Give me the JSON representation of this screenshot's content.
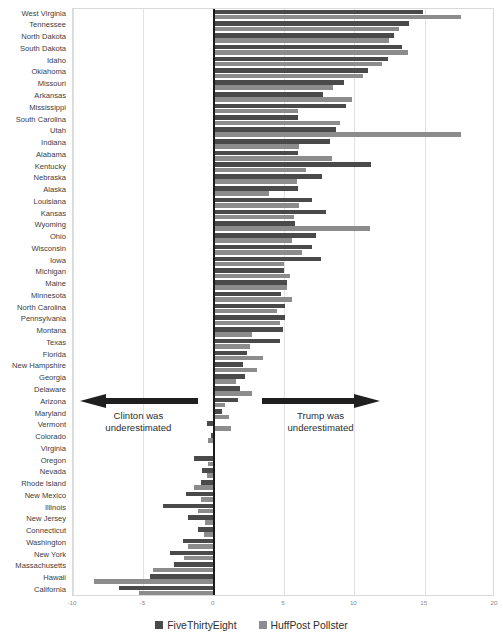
{
  "chart_data": {
    "type": "bar",
    "orientation": "horizontal",
    "title": "",
    "xlabel": "",
    "ylabel": "",
    "xlim": [
      -10,
      20
    ],
    "xticks": [
      -10,
      -5,
      0,
      5,
      10,
      15,
      20
    ],
    "grid": true,
    "legend_position": "bottom",
    "categories": [
      "West Virginia",
      "Tennessee",
      "North Dakota",
      "South Dakota",
      "Idaho",
      "Oklahoma",
      "Missouri",
      "Arkansas",
      "Mississippi",
      "South Carolina",
      "Utah",
      "Indiana",
      "Alabama",
      "Kentucky",
      "Nebraska",
      "Alaska",
      "Louisiana",
      "Kansas",
      "Wyoming",
      "Ohio",
      "Wisconsin",
      "Iowa",
      "Michigan",
      "Maine",
      "Minnesota",
      "North Carolina",
      "Pennsylvania",
      "Montana",
      "Texas",
      "Florida",
      "New Hampshire",
      "Georgia",
      "Delaware",
      "Arizona",
      "Maryland",
      "Vermont",
      "Colorado",
      "Virginia",
      "Oregon",
      "Nevada",
      "Rhode Island",
      "New Mexico",
      "Illinois",
      "New Jersey",
      "Connecticut",
      "Washington",
      "New York",
      "Massachusetts",
      "Hawaii",
      "California"
    ],
    "series": [
      {
        "name": "FiveThirtyEight",
        "color": "#4a4a4a",
        "values": [
          14.9,
          13.9,
          12.8,
          13.4,
          12.4,
          11.0,
          9.3,
          7.8,
          9.4,
          6.0,
          8.7,
          8.3,
          6.0,
          11.2,
          7.7,
          6.0,
          7.0,
          8.0,
          5.8,
          7.3,
          7.0,
          7.6,
          5.0,
          5.2,
          4.8,
          5.1,
          5.1,
          4.9,
          4.7,
          2.4,
          2.1,
          2.2,
          1.9,
          1.7,
          0.6,
          -0.5,
          -0.2,
          0.1,
          -1.4,
          -0.8,
          -0.9,
          -2.0,
          -3.6,
          -1.8,
          -1.1,
          -2.2,
          -3.1,
          -2.8,
          -4.5,
          -6.7
        ]
      },
      {
        "name": "HuffPost Pollster",
        "color": "#8c8c8c",
        "values": [
          17.6,
          13.2,
          12.5,
          13.8,
          12.0,
          10.6,
          8.5,
          9.8,
          6.0,
          9.0,
          17.6,
          6.1,
          8.4,
          6.6,
          5.9,
          3.9,
          6.1,
          5.7,
          11.1,
          5.6,
          6.3,
          5.0,
          5.4,
          5.2,
          5.6,
          4.5,
          4.7,
          2.7,
          2.6,
          3.5,
          3.1,
          1.6,
          2.7,
          0.8,
          1.1,
          1.2,
          -0.4,
          0.1,
          -0.4,
          -0.5,
          -1.4,
          -0.9,
          -1.1,
          -0.6,
          -0.7,
          -1.8,
          -2.1,
          -4.3,
          -8.5,
          -5.3
        ]
      }
    ],
    "annotations": [
      {
        "id": "clinton-underestimated",
        "line1": "Clinton was",
        "line2": "underestimated",
        "arrow": "left-arrow-icon"
      },
      {
        "id": "trump-underestimated",
        "line1": "Trump was",
        "line2": "underestimated",
        "arrow": "right-arrow-icon"
      }
    ]
  },
  "legend": {
    "items": [
      {
        "label": "FiveThirtyEight",
        "color": "#4a4a4a",
        "swatch_name": "legend-swatch-fivethirtyeight"
      },
      {
        "label": "HuffPost Pollster",
        "color": "#8c8c8c",
        "swatch_name": "legend-swatch-huffpost-pollster"
      }
    ]
  }
}
